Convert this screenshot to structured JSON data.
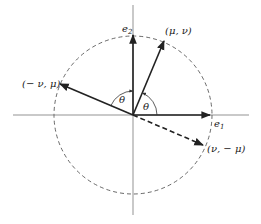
{
  "diagram": {
    "type": "unit-circle-rotation",
    "colors": {
      "stroke": "#222222",
      "axis": "#555555",
      "circle": "#444444",
      "background": "#ffffff"
    },
    "origin": [
      133,
      115
    ],
    "radius": 79,
    "axes": {
      "horizontal": [
        13,
        249
      ],
      "vertical": [
        5,
        215
      ]
    },
    "vectors": [
      {
        "id": "e2",
        "label": "e",
        "subscript": "2",
        "end": [
          133,
          34
        ],
        "style": "solid",
        "label_pos": [
          122,
          30
        ]
      },
      {
        "id": "e1",
        "label": "e",
        "subscript": "1",
        "end": [
          211,
          115
        ],
        "style": "solid",
        "label_pos": [
          214,
          127
        ]
      },
      {
        "id": "mu-nu",
        "label": "(μ, ν)",
        "end": [
          164,
          40
        ],
        "style": "solid",
        "label_pos": [
          165,
          34
        ]
      },
      {
        "id": "neg-nu-mu",
        "label": "(− ν, μ)",
        "end": [
          59,
          84
        ],
        "style": "solid",
        "label_pos": [
          22,
          87
        ]
      },
      {
        "id": "nu-neg-mu",
        "label": "(ν, − μ)",
        "end": [
          204,
          146
        ],
        "style": "dashed",
        "label_pos": [
          207,
          152
        ]
      }
    ],
    "angles": [
      {
        "id": "theta-left",
        "label": "θ",
        "label_pos": [
          119,
          103
        ]
      },
      {
        "id": "theta-right",
        "label": "θ",
        "label_pos": [
          143,
          108
        ]
      }
    ]
  }
}
